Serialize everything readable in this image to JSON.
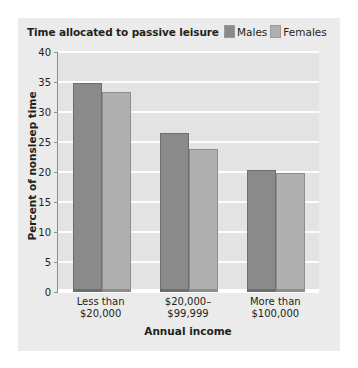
{
  "chart_data": {
    "type": "bar",
    "title": "Time allocated to passive leisure",
    "xlabel": "Annual income",
    "ylabel": "Percent of nonsleep time",
    "categories": [
      "Less than\n$20,000",
      "$20,000–\n$99,999",
      "More than\n$100,000"
    ],
    "category_lines": [
      [
        "Less than",
        "$20,000"
      ],
      [
        "$20,000–",
        "$99,999"
      ],
      [
        "More than",
        "$100,000"
      ]
    ],
    "series": [
      {
        "name": "Males",
        "values": [
          34.8,
          26.5,
          20.3
        ],
        "color": "#8a8a8a"
      },
      {
        "name": "Females",
        "values": [
          33.3,
          23.8,
          19.8
        ],
        "color": "#b0b0b0"
      }
    ],
    "ylim": [
      0,
      40
    ],
    "yticks": [
      0,
      5,
      10,
      15,
      20,
      25,
      30,
      35,
      40
    ],
    "ytick_labels": [
      "0",
      "5",
      "10",
      "15",
      "20",
      "25",
      "30",
      "35",
      "40"
    ],
    "grid": true,
    "legend_position": "top-right"
  },
  "credit": "© Cengage Learning",
  "colors": {
    "panel_background": "#ebebeb",
    "plot_background": "#e3e3e3",
    "gridline": "#fdfdfd",
    "axis": "#8d8d8d",
    "text": "#231f20",
    "males": "#8a8a8a",
    "females": "#b0b0b0"
  }
}
